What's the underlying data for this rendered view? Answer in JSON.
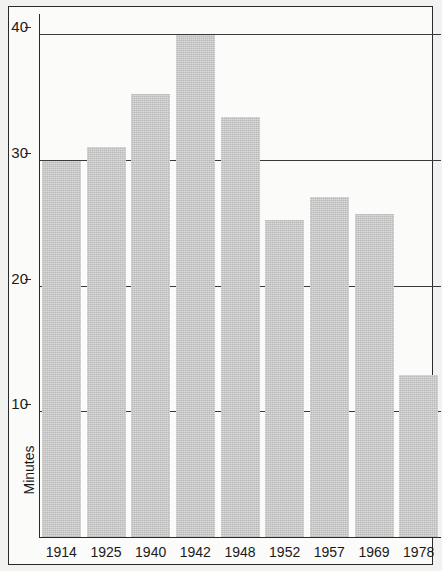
{
  "chart_data": {
    "type": "bar",
    "title": "",
    "subtitle": "",
    "xlabel": "",
    "ylabel": "Minutes",
    "categories": [
      "1914",
      "1925",
      "1940",
      "1942",
      "1948",
      "1952",
      "1957",
      "1969",
      "1978"
    ],
    "values": [
      30.0,
      31.1,
      35.3,
      40.0,
      33.5,
      25.3,
      27.1,
      25.8,
      13.0
    ],
    "ylim": [
      0,
      42
    ],
    "yticks": [
      10,
      20,
      30,
      40
    ],
    "ytick_labels": [
      "10",
      "20",
      "30",
      "40"
    ],
    "grid": "horizontal",
    "legend": "none",
    "bar_color": "#b9b9b9",
    "axis_color": "#2a2a2a",
    "background_color": "#fbfbfa"
  }
}
